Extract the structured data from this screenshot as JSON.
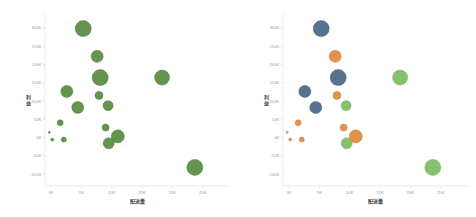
{
  "page": {
    "background": "#ffffff"
  },
  "colors": {
    "forest": {
      "fill": "#578b3f",
      "stroke": "#4c7c36"
    },
    "blue": {
      "fill": "#4a6785",
      "stroke": "#405c79"
    },
    "orange": {
      "fill": "#dd8a3d",
      "stroke": "#cc7c30"
    },
    "green": {
      "fill": "#7cbd62",
      "stroke": "#6dae53"
    },
    "axis_line": "#dcdcdc",
    "tick_mark": "#cfcfcf",
    "tick_label": "#9b9b9b",
    "axis_title": "#4a4a4a"
  },
  "chart_data": [
    {
      "type": "scatter",
      "title": "",
      "xlabel": "配送量",
      "ylabel": "利益",
      "legend": "none",
      "grid": false,
      "color_mode": "single",
      "xlim": [
        -1000,
        29500
      ],
      "ylim": [
        -133000,
        338000
      ],
      "x_ticks": [
        0,
        5000,
        10000,
        15000,
        20000,
        25000
      ],
      "x_tick_labels": [
        "0K",
        "5K",
        "10K",
        "15K",
        "20K",
        "25K"
      ],
      "y_ticks": [
        -100000,
        -50000,
        0,
        50000,
        100000,
        150000,
        200000,
        250000,
        300000
      ],
      "y_tick_labels": [
        "-100K",
        "-50K",
        "0K",
        "50K",
        "100K",
        "150K",
        "200K",
        "250K",
        "300K"
      ],
      "points": [
        {
          "x": 5300,
          "y": 298000,
          "size": 16,
          "category": "forest"
        },
        {
          "x": 7600,
          "y": 222000,
          "size": 12,
          "category": "forest"
        },
        {
          "x": 8100,
          "y": 164000,
          "size": 16,
          "category": "forest"
        },
        {
          "x": 18300,
          "y": 164000,
          "size": 15,
          "category": "forest"
        },
        {
          "x": 2600,
          "y": 126000,
          "size": 12,
          "category": "forest"
        },
        {
          "x": 7900,
          "y": 115000,
          "size": 8,
          "category": "forest"
        },
        {
          "x": 9400,
          "y": 87000,
          "size": 10,
          "category": "forest"
        },
        {
          "x": 4400,
          "y": 82000,
          "size": 12,
          "category": "forest"
        },
        {
          "x": 1500,
          "y": 40000,
          "size": 6,
          "category": "forest"
        },
        {
          "x": 9000,
          "y": 27000,
          "size": 7,
          "category": "forest"
        },
        {
          "x": -300,
          "y": 14000,
          "size": 2,
          "category": "forest"
        },
        {
          "x": 200,
          "y": -6000,
          "size": 3,
          "category": "forest"
        },
        {
          "x": 2100,
          "y": -6000,
          "size": 5,
          "category": "forest"
        },
        {
          "x": 9500,
          "y": -16000,
          "size": 11,
          "category": "forest"
        },
        {
          "x": 11000,
          "y": 3000,
          "size": 13,
          "category": "forest"
        },
        {
          "x": 23700,
          "y": -82000,
          "size": 16,
          "category": "forest"
        }
      ]
    },
    {
      "type": "scatter",
      "title": "",
      "xlabel": "配送量",
      "ylabel": "利益",
      "legend": "none",
      "grid": false,
      "color_mode": "category",
      "xlim": [
        -1000,
        29500
      ],
      "ylim": [
        -133000,
        338000
      ],
      "x_ticks": [
        0,
        5000,
        10000,
        15000,
        20000,
        25000
      ],
      "x_tick_labels": [
        "0K",
        "5K",
        "10K",
        "15K",
        "20K",
        "25K"
      ],
      "y_ticks": [
        -100000,
        -50000,
        0,
        50000,
        100000,
        150000,
        200000,
        250000,
        300000
      ],
      "y_tick_labels": [
        "-100K",
        "-50K",
        "0K",
        "50K",
        "100K",
        "150K",
        "200K",
        "250K",
        "300K"
      ],
      "points": [
        {
          "x": 5300,
          "y": 298000,
          "size": 16,
          "category": "blue"
        },
        {
          "x": 7600,
          "y": 222000,
          "size": 12,
          "category": "orange"
        },
        {
          "x": 8100,
          "y": 164000,
          "size": 16,
          "category": "blue"
        },
        {
          "x": 18300,
          "y": 164000,
          "size": 15,
          "category": "green"
        },
        {
          "x": 2600,
          "y": 126000,
          "size": 12,
          "category": "blue"
        },
        {
          "x": 7900,
          "y": 115000,
          "size": 8,
          "category": "orange"
        },
        {
          "x": 9400,
          "y": 87000,
          "size": 10,
          "category": "green"
        },
        {
          "x": 4400,
          "y": 82000,
          "size": 12,
          "category": "blue"
        },
        {
          "x": 1500,
          "y": 40000,
          "size": 6,
          "category": "orange"
        },
        {
          "x": 9000,
          "y": 27000,
          "size": 7,
          "category": "orange"
        },
        {
          "x": -300,
          "y": 14000,
          "size": 2,
          "category": "orange"
        },
        {
          "x": 200,
          "y": -6000,
          "size": 3,
          "category": "orange"
        },
        {
          "x": 2100,
          "y": -6000,
          "size": 5,
          "category": "orange"
        },
        {
          "x": 9500,
          "y": -16000,
          "size": 11,
          "category": "green"
        },
        {
          "x": 11000,
          "y": 3000,
          "size": 13,
          "category": "orange"
        },
        {
          "x": 23700,
          "y": -82000,
          "size": 16,
          "category": "green"
        }
      ]
    }
  ]
}
